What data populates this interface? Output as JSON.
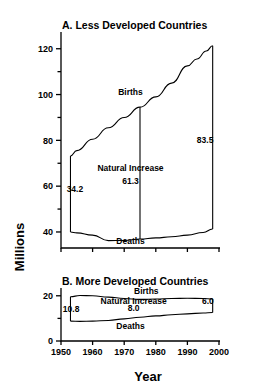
{
  "figure": {
    "ylabel": "Millions",
    "xlabel": "Year"
  },
  "chart_data": [
    {
      "type": "line",
      "title": "A. Less Developed Countries",
      "xlabel": "Year",
      "ylabel": "Millions",
      "xlim": [
        1950,
        2000
      ],
      "ylim": [
        33,
        126
      ],
      "xticks": [
        1950,
        1960,
        1970,
        1980,
        1990,
        2000
      ],
      "yticks": [
        40,
        60,
        80,
        100,
        120
      ],
      "yticks_minor": [
        50,
        70,
        90,
        110
      ],
      "grid": false,
      "legend": "inline-labels",
      "series": [
        {
          "name": "Births",
          "x": [
            1953,
            1955,
            1960,
            1965,
            1970,
            1975,
            1980,
            1985,
            1990,
            1993,
            1996,
            1998
          ],
          "values": [
            73.2,
            75.5,
            80.5,
            85.5,
            90.0,
            94.5,
            99.0,
            105.0,
            112.5,
            115.5,
            119.0,
            121.3
          ]
        },
        {
          "name": "Deaths",
          "x": [
            1953,
            1955,
            1960,
            1965,
            1970,
            1975,
            1980,
            1985,
            1990,
            1995,
            1998
          ],
          "values": [
            40.0,
            39.6,
            38.6,
            36.2,
            36.3,
            36.9,
            37.4,
            37.9,
            38.6,
            39.8,
            41.3
          ]
        }
      ],
      "annotations": [
        {
          "name": "births-label",
          "text": "Births",
          "x": 1972,
          "y": 100.0
        },
        {
          "name": "deaths-label",
          "text": "Deaths",
          "x": 1972,
          "y": 34.6
        },
        {
          "name": "natural-increase-label",
          "text": "Natural Increase",
          "x": 1972,
          "y": 66.5
        },
        {
          "name": "natural-increase-value",
          "text": "61.3",
          "x": 1972,
          "y": 61.0
        },
        {
          "name": "start-gap-value",
          "text": "34.2",
          "x": 1954.4,
          "y": 57.5
        },
        {
          "name": "end-gap-value",
          "text": "83.5",
          "x": 1995.6,
          "y": 79.0
        }
      ],
      "connectors": [
        {
          "name": "gap-1953",
          "x": 1953,
          "y0": 73.2,
          "y1": 40.0,
          "value": "34.2"
        },
        {
          "name": "gap-1975",
          "x": 1975,
          "y0": 94.5,
          "y1": 36.9,
          "value": "61.3"
        },
        {
          "name": "gap-1998",
          "x": 1998,
          "y0": 121.3,
          "y1": 41.3,
          "value": "83.5"
        }
      ]
    },
    {
      "type": "line",
      "title": "B. More Developed Countries",
      "xlabel": "Year",
      "ylabel": "Millions",
      "xlim": [
        1950,
        2000
      ],
      "ylim": [
        0,
        23
      ],
      "xticks": [
        1950,
        1960,
        1970,
        1980,
        1990,
        2000
      ],
      "yticks": [
        0,
        20
      ],
      "yticks_minor": [
        10
      ],
      "grid": false,
      "legend": "inline-labels",
      "series": [
        {
          "name": "Births",
          "x": [
            1953,
            1956,
            1960,
            1965,
            1970,
            1975,
            1980,
            1985,
            1990,
            1995,
            1998
          ],
          "values": [
            19.6,
            20.1,
            20.0,
            19.4,
            18.8,
            18.4,
            18.6,
            18.8,
            18.9,
            18.8,
            18.6
          ]
        },
        {
          "name": "Deaths",
          "x": [
            1953,
            1956,
            1960,
            1965,
            1970,
            1975,
            1980,
            1985,
            1990,
            1995,
            1998
          ],
          "values": [
            8.8,
            8.7,
            8.8,
            9.1,
            9.8,
            10.5,
            11.1,
            11.6,
            12.0,
            12.4,
            12.6
          ]
        }
      ],
      "annotations": [
        {
          "name": "births-label",
          "text": "Births",
          "x": 1977,
          "y": 20.8
        },
        {
          "name": "deaths-label",
          "text": "Deaths",
          "x": 1972,
          "y": 5.4
        },
        {
          "name": "natural-increase-label",
          "text": "Natural Increase",
          "x": 1973,
          "y": 16.2
        },
        {
          "name": "natural-increase-value",
          "text": "8.0",
          "x": 1973,
          "y": 13.2
        },
        {
          "name": "start-gap-value",
          "text": "10.8",
          "x": 1953.2,
          "y": 13.0
        },
        {
          "name": "end-gap-value",
          "text": "6.0",
          "x": 1996.5,
          "y": 16.2
        }
      ],
      "connectors": [
        {
          "name": "gap-1953",
          "x": 1953,
          "y0": 19.6,
          "y1": 8.8,
          "value": "10.8"
        },
        {
          "name": "gap-1998",
          "x": 1998,
          "y0": 18.6,
          "y1": 12.6,
          "value": "6.0"
        }
      ]
    }
  ]
}
